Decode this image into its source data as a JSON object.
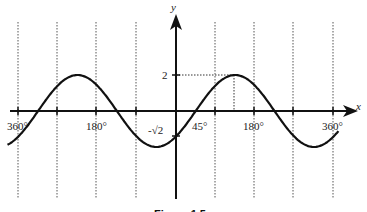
{
  "chart_data": {
    "type": "line",
    "title": "",
    "caption": "Figure 1.5",
    "function": "y = 2 sin(x - 45°)",
    "xlabel": "x",
    "ylabel": "y",
    "x_unit": "degrees",
    "xlim": [
      -360,
      360
    ],
    "ylim": [
      -2,
      2
    ],
    "grid": "vertical dotted lines every 90°",
    "x_tick_labels": [
      {
        "value": -360,
        "text": "360°"
      },
      {
        "value": -180,
        "text": "180°"
      },
      {
        "value": 45,
        "text": "45°"
      },
      {
        "value": 180,
        "text": "180°"
      },
      {
        "value": 360,
        "text": "360°"
      }
    ],
    "y_tick_labels": [
      {
        "value": 2,
        "text": "2"
      },
      {
        "value": -1.414,
        "text": "-√2"
      }
    ],
    "gridlines_x": [
      -360,
      -270,
      -180,
      -90,
      90,
      180,
      270,
      360
    ],
    "annotations": [
      {
        "type": "dotted-guide",
        "description": "horizontal from y-axis at y=2 to peak at x=135°"
      },
      {
        "type": "dotted-guide",
        "description": "vertical from peak (135°, 2) down to x-axis"
      }
    ],
    "key_points": [
      {
        "x": -315,
        "y": 0
      },
      {
        "x": -225,
        "y": 2
      },
      {
        "x": -135,
        "y": 0
      },
      {
        "x": -45,
        "y": -2
      },
      {
        "x": 0,
        "y": -1.414
      },
      {
        "x": 45,
        "y": 0
      },
      {
        "x": 135,
        "y": 2
      },
      {
        "x": 225,
        "y": 0
      },
      {
        "x": 315,
        "y": -2
      }
    ]
  },
  "labels": {
    "x_axis": "x",
    "y_axis": "y",
    "tick_neg360": "360°",
    "tick_neg180": "180°",
    "tick_45": "45°",
    "tick_180": "180°",
    "tick_360": "360°",
    "y_two": "2",
    "y_neg_root2": "-√2",
    "caption": "Figure 1.5"
  }
}
